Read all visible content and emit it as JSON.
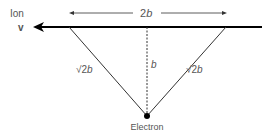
{
  "labels": {
    "ion": "Ion",
    "velocity": "v",
    "width": "2",
    "width_var": "b",
    "height": "b",
    "left_side_root": "√2",
    "left_side_var": "b",
    "right_side_root": "√2",
    "right_side_var": "b",
    "electron": "Electron"
  },
  "colors": {
    "line": "#000000",
    "thin_line": "#333333",
    "text": "#555555"
  }
}
